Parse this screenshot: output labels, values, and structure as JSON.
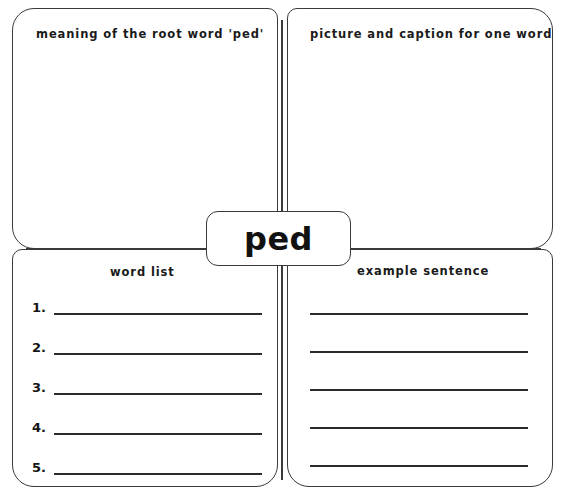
{
  "worksheet": {
    "root_word": "ped",
    "quadrants": {
      "top_left": {
        "header": "meaning of the root word 'ped'"
      },
      "top_right": {
        "header": "picture and caption for one word"
      },
      "bottom_left": {
        "header": "word list",
        "items": [
          {
            "number": "1.",
            "value": ""
          },
          {
            "number": "2.",
            "value": ""
          },
          {
            "number": "3.",
            "value": ""
          },
          {
            "number": "4.",
            "value": ""
          },
          {
            "number": "5.",
            "value": ""
          }
        ]
      },
      "bottom_right": {
        "header": "example sentence",
        "lines": [
          "",
          "",
          "",
          "",
          ""
        ]
      }
    },
    "colors": {
      "stroke": "#3a3a3a",
      "rule": "#2b2b2b",
      "text": "#1a1a1a",
      "background": "#ffffff"
    }
  }
}
